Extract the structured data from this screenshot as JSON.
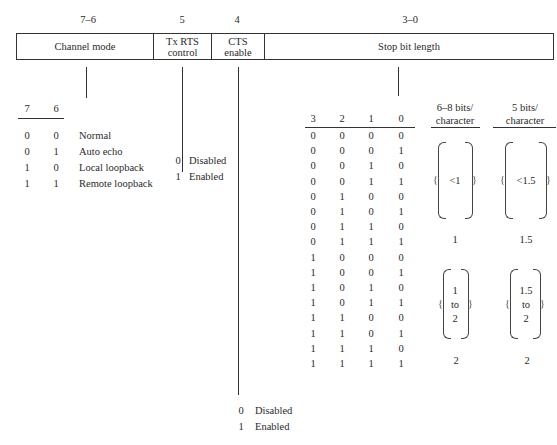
{
  "register": {
    "bit_labels": {
      "channel_mode": "7–6",
      "tx_rts": "5",
      "cts": "4",
      "stop_bits": "3–0"
    },
    "fields": {
      "channel_mode": {
        "line1": "Channel mode"
      },
      "tx_rts": {
        "line1": "Tx RTS",
        "line2": "control"
      },
      "cts": {
        "line1": "CTS",
        "line2": "enable"
      },
      "stop_bits": {
        "line1": "Stop bit length"
      }
    }
  },
  "channel_mode_table": {
    "headers": [
      "7",
      "6"
    ],
    "rows": [
      {
        "b7": "0",
        "b6": "0",
        "label": "Normal"
      },
      {
        "b7": "0",
        "b6": "1",
        "label": "Auto echo"
      },
      {
        "b7": "1",
        "b6": "0",
        "label": "Local loopback"
      },
      {
        "b7": "1",
        "b6": "1",
        "label": "Remote loopback"
      }
    ]
  },
  "tx_rts_options": [
    {
      "value": "0",
      "label": "Disabled"
    },
    {
      "value": "1",
      "label": "Enabled"
    }
  ],
  "cts_options": [
    {
      "value": "0",
      "label": "Disabled"
    },
    {
      "value": "1",
      "label": "Enabled"
    }
  ],
  "stop_bit_table": {
    "headers": [
      "3",
      "2",
      "1",
      "0"
    ],
    "col_68": {
      "line1": "6–8 bits/",
      "line2": "character"
    },
    "col_5": {
      "line1": "5 bits/",
      "line2": "character"
    },
    "rows": [
      [
        "0",
        "0",
        "0",
        "0"
      ],
      [
        "0",
        "0",
        "0",
        "1"
      ],
      [
        "0",
        "0",
        "1",
        "0"
      ],
      [
        "0",
        "0",
        "1",
        "1"
      ],
      [
        "0",
        "1",
        "0",
        "0"
      ],
      [
        "0",
        "1",
        "0",
        "1"
      ],
      [
        "0",
        "1",
        "1",
        "0"
      ],
      [
        "0",
        "1",
        "1",
        "1"
      ],
      [
        "1",
        "0",
        "0",
        "0"
      ],
      [
        "1",
        "0",
        "0",
        "1"
      ],
      [
        "1",
        "0",
        "1",
        "0"
      ],
      [
        "1",
        "0",
        "1",
        "1"
      ],
      [
        "1",
        "1",
        "0",
        "0"
      ],
      [
        "1",
        "1",
        "0",
        "1"
      ],
      [
        "1",
        "1",
        "1",
        "0"
      ],
      [
        "1",
        "1",
        "1",
        "1"
      ]
    ],
    "groups": {
      "g1": {
        "v68": "<1",
        "v5": "<1.5"
      },
      "g2": {
        "v68": "1",
        "v5": "1.5"
      },
      "g3": {
        "v68_a": "1",
        "v68_b": "to",
        "v68_c": "2",
        "v5_a": "1.5",
        "v5_b": "to",
        "v5_c": "2"
      },
      "g4": {
        "v68": "2",
        "v5": "2"
      }
    }
  }
}
